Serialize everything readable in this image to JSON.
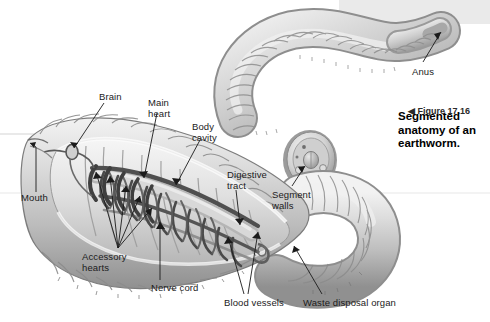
{
  "figure": {
    "alt_title": "Segmented anatomy of an earthworm",
    "organism": "earthworm",
    "style": "grayscale textbook illustration, cutaway anatomical view"
  },
  "caption": {
    "marker": "◀",
    "number": "Figure 17.16",
    "text": "Segmented\nanatomy of an\nearthworm."
  },
  "labels": [
    {
      "id": "brain",
      "text": "Brain",
      "x": 99,
      "y": 92
    },
    {
      "id": "main-heart",
      "text": "Main\nheart",
      "x": 148,
      "y": 98
    },
    {
      "id": "body-cavity",
      "text": "Body\ncavity",
      "x": 192,
      "y": 122
    },
    {
      "id": "digestive-tract",
      "text": "Digestive\ntract",
      "x": 227,
      "y": 170
    },
    {
      "id": "segment-walls",
      "text": "Segment\nwalls",
      "x": 272,
      "y": 190
    },
    {
      "id": "anus",
      "text": "Anus",
      "x": 412,
      "y": 67
    },
    {
      "id": "mouth",
      "text": "Mouth",
      "x": 21,
      "y": 193
    },
    {
      "id": "accessory-hearts",
      "text": "Accessory\nhearts",
      "x": 82,
      "y": 252
    },
    {
      "id": "nerve-cord",
      "text": "Nerve cord",
      "x": 151,
      "y": 283
    },
    {
      "id": "blood-vessels",
      "text": "Blood vessels",
      "x": 224,
      "y": 298
    },
    {
      "id": "waste-disposal-organ",
      "text": "Waste disposal organ",
      "x": 303,
      "y": 298
    }
  ],
  "anatomy_parts": [
    "Brain",
    "Main heart",
    "Body cavity",
    "Digestive tract",
    "Segment walls",
    "Anus",
    "Mouth",
    "Accessory hearts",
    "Nerve cord",
    "Blood vessels",
    "Waste disposal organ"
  ],
  "colors": {
    "background": "#ffffff",
    "body_light": "#e3e3e3",
    "body_mid": "#c4c4c4",
    "body_shade": "#a2a2a2",
    "body_dark": "#7d7d7d",
    "organ_dark": "#5a5a5a",
    "vessel_dark": "#4a4a4a",
    "outline": "#4d4d4d",
    "leader_line": "#1b1b1b",
    "text": "#1b1b1b",
    "scan_band": "#e6e6e6"
  }
}
